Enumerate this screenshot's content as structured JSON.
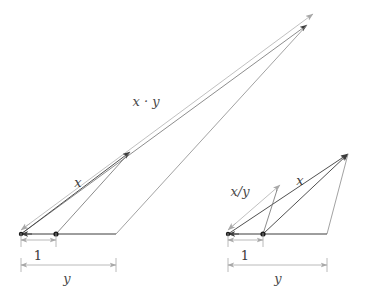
{
  "figure": {
    "colors": {
      "background": "#ffffff",
      "dark_line": "#3c3c3c",
      "gray_line": "#b0b0b0",
      "dimension_line": "#a8a8a8",
      "label_text": "#4a4a4a",
      "point_fill": "#1a1a1a"
    },
    "stroke_widths": {
      "dark": 0.9,
      "gray": 0.8,
      "dimension": 0.8
    }
  },
  "left_diagram": {
    "name": "multiplication-construction",
    "labels": {
      "product": "x · y",
      "unit_side": "x",
      "base_unit": "1",
      "base_scale": "y"
    },
    "label_positions": {
      "product": {
        "x": 146,
        "y": 102
      },
      "unit_side": {
        "x": 78,
        "y": 183
      },
      "base_unit": {
        "x": 38,
        "y": 246
      },
      "base_scale": {
        "x": 67,
        "y": 277
      }
    },
    "geometry": {
      "origin": {
        "x": 21,
        "y": 234
      },
      "unit_point": {
        "x": 56,
        "y": 234
      },
      "base_end": {
        "x": 116,
        "y": 234
      },
      "x_tip": {
        "x": 130,
        "y": 152
      },
      "xy_tip_outer": {
        "x": 313,
        "y": 14
      },
      "xy_tip_inner": {
        "x": 307,
        "y": 25
      },
      "right_edge_foot": {
        "x": 116,
        "y": 234
      }
    },
    "points": [
      {
        "name": "origin-point",
        "x": 21,
        "y": 234
      },
      {
        "name": "unit-point",
        "x": 56,
        "y": 234
      }
    ],
    "dimensions": [
      {
        "name": "unit-dimension",
        "label": "1",
        "x1": 21,
        "x2": 56,
        "y": 240
      },
      {
        "name": "scale-dimension",
        "label": "y",
        "x1": 21,
        "x2": 116,
        "y": 265
      }
    ]
  },
  "right_diagram": {
    "name": "division-construction",
    "labels": {
      "quotient": "x/y",
      "unit_side": "x",
      "base_unit": "1",
      "base_scale": "y"
    },
    "label_positions": {
      "quotient": {
        "x": 240,
        "y": 192
      },
      "unit_side": {
        "x": 297,
        "y": 181
      },
      "base_unit": {
        "x": 249,
        "y": 246
      },
      "base_scale": {
        "x": 278,
        "y": 277
      }
    },
    "geometry": {
      "origin": {
        "x": 228,
        "y": 234
      },
      "unit_point": {
        "x": 263,
        "y": 234
      },
      "base_end": {
        "x": 327,
        "y": 234
      },
      "apex": {
        "x": 348,
        "y": 154
      },
      "quotient_tip": {
        "x": 277,
        "y": 190
      },
      "inner_foot": {
        "x": 263,
        "y": 234
      },
      "inner_top": {
        "x": 277,
        "y": 190
      }
    },
    "points": [
      {
        "name": "origin-point",
        "x": 228,
        "y": 234
      },
      {
        "name": "unit-point",
        "x": 263,
        "y": 234
      }
    ],
    "dimensions": [
      {
        "name": "unit-dimension",
        "label": "1",
        "x1": 228,
        "x2": 263,
        "y": 240
      },
      {
        "name": "scale-dimension",
        "label": "y",
        "x1": 228,
        "x2": 327,
        "y": 265
      }
    ]
  }
}
